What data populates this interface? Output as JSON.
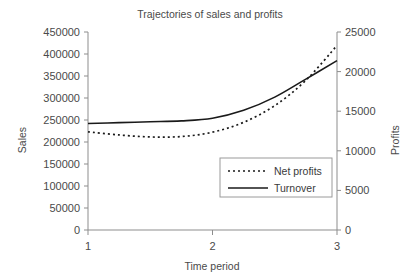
{
  "chart_data": {
    "type": "line",
    "title": "Trajectories of sales and profits",
    "xlabel": "Time period",
    "ylabel": "Sales",
    "y2label": "Profits",
    "grid": false,
    "legend_position": "center-right-inside",
    "x": [
      1,
      1.25,
      1.5,
      1.75,
      2,
      2.25,
      2.5,
      2.75,
      3
    ],
    "xlim": [
      1,
      3
    ],
    "xticks": [
      "1",
      "2",
      "3"
    ],
    "xtick_values": [
      1,
      2,
      3
    ],
    "ylim": [
      0,
      450000
    ],
    "yticks": [
      "0",
      "50000",
      "100000",
      "150000",
      "200000",
      "250000",
      "300000",
      "350000",
      "400000",
      "450000"
    ],
    "ytick_values": [
      0,
      50000,
      100000,
      150000,
      200000,
      250000,
      300000,
      350000,
      400000,
      450000
    ],
    "y2lim": [
      0,
      25000
    ],
    "y2ticks": [
      "0",
      "5000",
      "10000",
      "15000",
      "20000",
      "25000"
    ],
    "y2tick_values": [
      0,
      5000,
      10000,
      15000,
      20000,
      25000
    ],
    "series": [
      {
        "name": "Net profits",
        "axis": "right",
        "style": "dotted",
        "color": "#1a1a1a",
        "values": [
          12400,
          12000,
          11750,
          11800,
          12350,
          13600,
          15700,
          18900,
          23300
        ]
      },
      {
        "name": "Turnover",
        "axis": "left",
        "style": "solid",
        "color": "#1a1a1a",
        "values": [
          242000,
          244000,
          246000,
          248000,
          254000,
          272000,
          302000,
          343000,
          385000
        ]
      }
    ]
  },
  "legend": {
    "entries": [
      {
        "label": "Net profits",
        "style": "dotted"
      },
      {
        "label": "Turnover",
        "style": "solid"
      }
    ]
  }
}
